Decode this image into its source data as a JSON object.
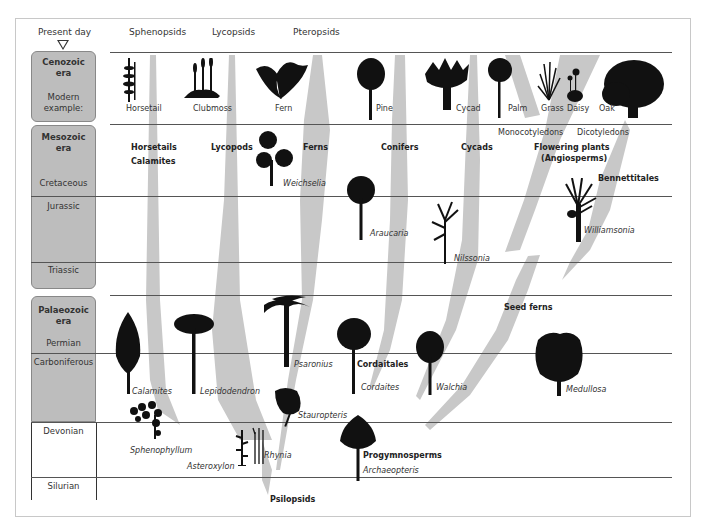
{
  "header": {
    "present_day": "Present day",
    "columns": [
      "Sphenopsids",
      "Lycopsids",
      "Pteropsids"
    ]
  },
  "eras": {
    "cenozoic": {
      "title": "Cenozoic era",
      "title_l1": "Cenozoic",
      "title_l2": "era",
      "sub_l1": "Modern",
      "sub_l2": "example:"
    },
    "mesozoic": {
      "title_l1": "Mesozoic",
      "title_l2": "era",
      "periods": [
        "Cretaceous",
        "Jurassic",
        "Triassic"
      ]
    },
    "palaeozoic": {
      "title_l1": "Palaeozoic",
      "title_l2": "era",
      "periods": [
        "Permian",
        "Carboniferous",
        "Devonian",
        "Silurian"
      ]
    }
  },
  "modern_examples": [
    "Horsetail",
    "Clubmoss",
    "Fern",
    "Pine",
    "Cycad",
    "Palm",
    "Grass",
    "Daisy",
    "Oak"
  ],
  "groupings": {
    "monocots": "Monocotyledons",
    "dicots": "Dicotyledons"
  },
  "clades": {
    "horsetails": "Horsetails",
    "calamites_group": "Calamites",
    "lycopods": "Lycopods",
    "ferns": "Ferns",
    "conifers": "Conifers",
    "cycads": "Cycads",
    "flowering_l1": "Flowering plants",
    "flowering_l2": "(Angiosperms)",
    "bennettitales": "Bennettitales",
    "seed_ferns": "Seed ferns",
    "cordaitales": "Cordaitales",
    "progymnosperms": "Progymnosperms",
    "psilopsids": "Psilopsids"
  },
  "fossil_species": {
    "weichselia": "Weichselia",
    "araucaria": "Araucaria",
    "nilssonia": "Nilssonia",
    "williamsonia": "Williamsonia",
    "calamites": "Calamites",
    "lepidodendron": "Lepidodendron",
    "psaronius": "Psaronius",
    "cordaites": "Cordaites",
    "walchia": "Walchia",
    "medullosa": "Medullosa",
    "sphenophyllum": "Sphenophyllum",
    "stauropteris": "Stauropteris",
    "asteroxylon": "Asteroxylon",
    "rhynia": "Rhynia",
    "archaeopteris": "Archaeopteris"
  },
  "colors": {
    "branch": "#c8c8c8",
    "era_box": "#bdbdbd",
    "silhouette": "#111111",
    "line": "#555555"
  }
}
